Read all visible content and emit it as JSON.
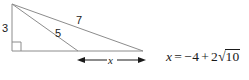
{
  "figure": {
    "type": "geometry-diagram",
    "stroke_color": "#8c8c8c",
    "text_color": "#1a1a1a",
    "background_color": "#ffffff",
    "labels": {
      "vertical_leg": "3",
      "inner_segment": "5",
      "outer_hypotenuse": "7",
      "dimension": "x"
    },
    "geometry": {
      "apex": [
        12,
        4
      ],
      "bottom_left": [
        12,
        51
      ],
      "bottom_right": [
        143,
        51
      ],
      "cevian_foot": [
        78,
        51
      ],
      "right_angle_marker": true,
      "dimension_arrow": {
        "from": [
          78,
          60
        ],
        "to": [
          145,
          60
        ],
        "double_headed": true
      }
    }
  },
  "equation": {
    "variable": "x",
    "equals": "=",
    "term_1": "−4",
    "operator": "+",
    "coefficient": "2",
    "radical_sign": "√",
    "radicand": "10",
    "full_text": "x = −4 + 2√10"
  }
}
